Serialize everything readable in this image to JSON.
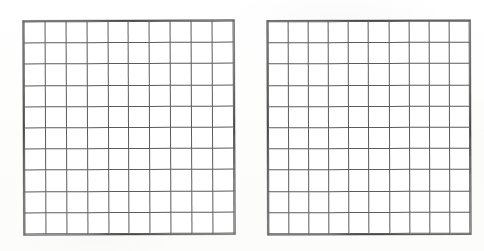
{
  "document": {
    "kind": "worksheet-scan",
    "background_color": "#fefefe",
    "grid_line_color": "#555555",
    "grid_frame_color": "#4a4a4a",
    "cell_fill_color": "#ffffff"
  },
  "grids": [
    {
      "id": "grid-left",
      "name": "left-hundred-grid",
      "rows": 10,
      "columns": 10,
      "total_cells": 100,
      "shaded_cells": 0,
      "label": "",
      "cell_values": [
        [
          "",
          "",
          "",
          "",
          "",
          "",
          "",
          "",
          "",
          ""
        ],
        [
          "",
          "",
          "",
          "",
          "",
          "",
          "",
          "",
          "",
          ""
        ],
        [
          "",
          "",
          "",
          "",
          "",
          "",
          "",
          "",
          "",
          ""
        ],
        [
          "",
          "",
          "",
          "",
          "",
          "",
          "",
          "",
          "",
          ""
        ],
        [
          "",
          "",
          "",
          "",
          "",
          "",
          "",
          "",
          "",
          ""
        ],
        [
          "",
          "",
          "",
          "",
          "",
          "",
          "",
          "",
          "",
          ""
        ],
        [
          "",
          "",
          "",
          "",
          "",
          "",
          "",
          "",
          "",
          ""
        ],
        [
          "",
          "",
          "",
          "",
          "",
          "",
          "",
          "",
          "",
          ""
        ],
        [
          "",
          "",
          "",
          "",
          "",
          "",
          "",
          "",
          "",
          ""
        ],
        [
          "",
          "",
          "",
          "",
          "",
          "",
          "",
          "",
          "",
          ""
        ]
      ]
    },
    {
      "id": "grid-right",
      "name": "right-hundred-grid",
      "rows": 10,
      "columns": 10,
      "total_cells": 100,
      "shaded_cells": 0,
      "label": "",
      "cell_values": [
        [
          "",
          "",
          "",
          "",
          "",
          "",
          "",
          "",
          "",
          ""
        ],
        [
          "",
          "",
          "",
          "",
          "",
          "",
          "",
          "",
          "",
          ""
        ],
        [
          "",
          "",
          "",
          "",
          "",
          "",
          "",
          "",
          "",
          ""
        ],
        [
          "",
          "",
          "",
          "",
          "",
          "",
          "",
          "",
          "",
          ""
        ],
        [
          "",
          "",
          "",
          "",
          "",
          "",
          "",
          "",
          "",
          ""
        ],
        [
          "",
          "",
          "",
          "",
          "",
          "",
          "",
          "",
          "",
          ""
        ],
        [
          "",
          "",
          "",
          "",
          "",
          "",
          "",
          "",
          "",
          ""
        ],
        [
          "",
          "",
          "",
          "",
          "",
          "",
          "",
          "",
          "",
          ""
        ],
        [
          "",
          "",
          "",
          "",
          "",
          "",
          "",
          "",
          "",
          ""
        ],
        [
          "",
          "",
          "",
          "",
          "",
          "",
          "",
          "",
          "",
          ""
        ]
      ]
    }
  ]
}
